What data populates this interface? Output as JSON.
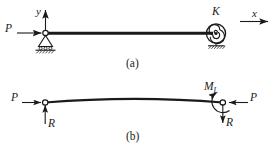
{
  "figure": {
    "type": "structural-mechanics-diagram",
    "stroke_color": "#1a1a1a",
    "background_color": "#ffffff"
  },
  "panel_a": {
    "caption": "(a)",
    "labels": {
      "axis_y": "y",
      "axis_x": "x",
      "spring_stiffness": "K",
      "load_left": "P"
    },
    "elements": {
      "beam": "horizontal-beam",
      "left_support": "pin-roller-support",
      "right_support": "torsional-spiral-spring",
      "ground_hatching": "hatched-ground"
    }
  },
  "panel_b": {
    "caption": "(b)",
    "labels": {
      "load_left": "P",
      "load_right": "P",
      "reaction_left": "R",
      "reaction_right": "R",
      "moment": "M",
      "moment_subscript": "L"
    },
    "elements": {
      "beam": "deflected-curved-beam",
      "left_node": "hinge-node",
      "right_node": "hinge-node",
      "moment_arrow": "curved-moment-arrow"
    }
  }
}
